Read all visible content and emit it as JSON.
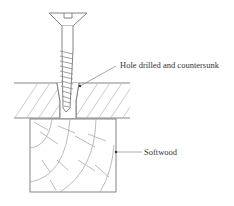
{
  "diagram": {
    "type": "technical-illustration",
    "labels": {
      "hole": "Hole drilled and countersunk",
      "softwood": "Softwood"
    },
    "components": [
      {
        "name": "countersunk-screw",
        "parts": [
          "slotted head",
          "shank",
          "threads"
        ]
      },
      {
        "name": "top-board",
        "hatching": "diagonal"
      },
      {
        "name": "softwood-block",
        "grain": "end grain rings"
      }
    ],
    "colors": {
      "line": "#777777",
      "hatch": "#b8b8b8",
      "text": "#333333",
      "background": "#ffffff"
    }
  }
}
